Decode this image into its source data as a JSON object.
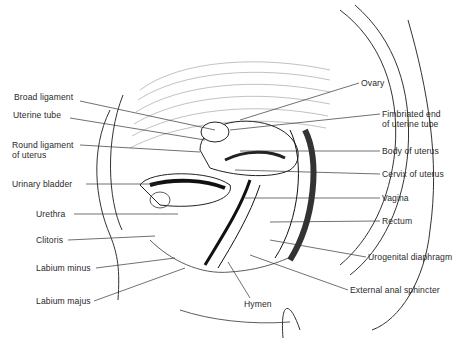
{
  "figure": {
    "left_labels": [
      {
        "id": "broad-ligament",
        "text": "Broad ligament",
        "x": 14,
        "y": 97
      },
      {
        "id": "uterine-tube",
        "text": "Uterine tube",
        "x": 13,
        "y": 114
      },
      {
        "id": "round-ligament",
        "text": "Round ligament",
        "text2": "of uterus",
        "x": 12,
        "y": 140
      },
      {
        "id": "urinary-bladder",
        "text": "Urinary bladder",
        "x": 12,
        "y": 180
      },
      {
        "id": "urethra",
        "text": "Urethra",
        "x": 36,
        "y": 210
      },
      {
        "id": "clitoris",
        "text": "Clitoris",
        "x": 36,
        "y": 236
      },
      {
        "id": "labium-minus",
        "text": "Labium minus",
        "x": 36,
        "y": 264
      },
      {
        "id": "labium-majus",
        "text": "Labium majus",
        "x": 36,
        "y": 297
      }
    ],
    "right_labels": [
      {
        "id": "ovary",
        "text": "Ovary",
        "x": 361,
        "y": 79
      },
      {
        "id": "fimbriated-end",
        "text": "Fimbriated end",
        "text2": "of uterine tube",
        "x": 382,
        "y": 110
      },
      {
        "id": "body-of-uterus",
        "text": "Body of uterus",
        "x": 382,
        "y": 147
      },
      {
        "id": "cervix-of-uterus",
        "text": "Cervix of uterus",
        "x": 382,
        "y": 170
      },
      {
        "id": "vagina",
        "text": "Vagina",
        "x": 382,
        "y": 194
      },
      {
        "id": "rectum",
        "text": "Rectum",
        "x": 382,
        "y": 217
      },
      {
        "id": "urogenital-diaphragm",
        "text": "Urogenital diaphragm",
        "x": 368,
        "y": 253
      },
      {
        "id": "external-anal-sphincter",
        "text": "External anal sphincter",
        "x": 350,
        "y": 286
      }
    ],
    "bottom_labels": [
      {
        "id": "hymen",
        "text": "Hymen",
        "x": 244,
        "y": 300
      }
    ]
  }
}
